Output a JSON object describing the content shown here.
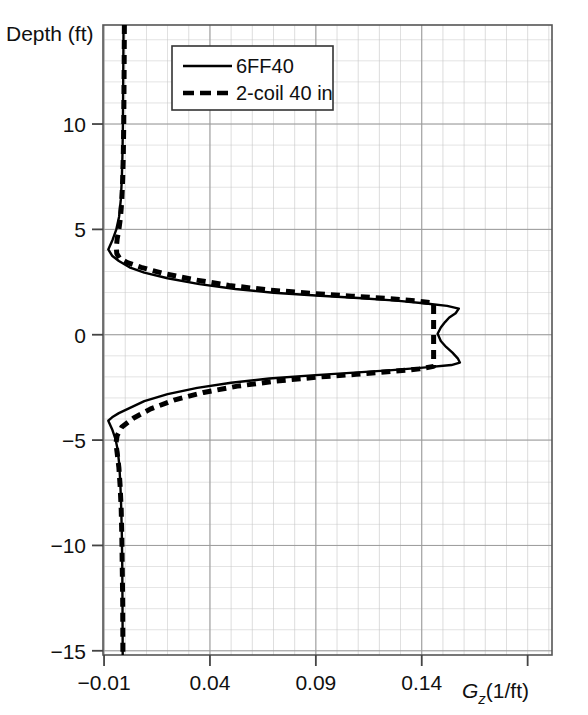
{
  "chart_data": {
    "type": "line",
    "title": "",
    "xlabel": "Gz(1/ft)",
    "xlabel_symbol": "G",
    "xlabel_subscript": "z",
    "xlabel_units": "(1/ft)",
    "ylabel": "Depth (ft)",
    "xlim": [
      -0.0105,
      0.2015
    ],
    "ylim": [
      -15.2,
      14.7
    ],
    "xticks": [
      -0.01,
      0.04,
      0.09,
      0.14
    ],
    "xtick_labels": [
      "−0.01",
      "0.04",
      "0.09",
      "0.14"
    ],
    "yticks": [
      10,
      5,
      0,
      -5,
      -10,
      -15
    ],
    "ytick_labels": [
      "10",
      "5",
      "0",
      "−5",
      "−10",
      "−15"
    ],
    "x_minor_step": 0.01,
    "y_minor_step": 1,
    "grid": true,
    "grid_color": "#c8c8c8",
    "axis_color": "#555555",
    "line_color": "#000000",
    "background": "#ffffff",
    "legend": {
      "position": "top-left-inside",
      "entries": [
        {
          "label": "6FF40",
          "style": "solid"
        },
        {
          "label": "2-coil 40 in",
          "style": "dashed"
        }
      ]
    },
    "series": [
      {
        "name": "6FF40",
        "style": "solid",
        "xname": "Gz",
        "yname": "Depth",
        "points": [
          [
            -0.0008,
            14.7
          ],
          [
            -0.0009,
            13.0
          ],
          [
            -0.001,
            11.5
          ],
          [
            -0.0011,
            10.0
          ],
          [
            -0.0013,
            8.6
          ],
          [
            -0.0016,
            7.4
          ],
          [
            -0.0021,
            6.4
          ],
          [
            -0.0029,
            5.6
          ],
          [
            -0.0042,
            5.0
          ],
          [
            -0.006,
            4.5
          ],
          [
            -0.008,
            4.05
          ],
          [
            -0.0062,
            3.75
          ],
          [
            -0.003,
            3.5
          ],
          [
            0.002,
            3.2
          ],
          [
            0.009,
            2.95
          ],
          [
            0.02,
            2.68
          ],
          [
            0.035,
            2.4
          ],
          [
            0.052,
            2.17
          ],
          [
            0.07,
            1.99
          ],
          [
            0.09,
            1.86
          ],
          [
            0.11,
            1.74
          ],
          [
            0.128,
            1.62
          ],
          [
            0.142,
            1.48
          ],
          [
            0.152,
            1.37
          ],
          [
            0.1575,
            1.24
          ],
          [
            0.156,
            1.02
          ],
          [
            0.153,
            0.82
          ],
          [
            0.151,
            0.6
          ],
          [
            0.149,
            0.34
          ],
          [
            0.1475,
            0.05
          ],
          [
            0.149,
            -0.3
          ],
          [
            0.1515,
            -0.58
          ],
          [
            0.1545,
            -0.85
          ],
          [
            0.157,
            -1.12
          ],
          [
            0.158,
            -1.32
          ],
          [
            0.154,
            -1.44
          ],
          [
            0.142,
            -1.55
          ],
          [
            0.126,
            -1.68
          ],
          [
            0.108,
            -1.8
          ],
          [
            0.088,
            -1.93
          ],
          [
            0.068,
            -2.08
          ],
          [
            0.05,
            -2.28
          ],
          [
            0.034,
            -2.52
          ],
          [
            0.02,
            -2.82
          ],
          [
            0.009,
            -3.15
          ],
          [
            0.002,
            -3.48
          ],
          [
            -0.003,
            -3.72
          ],
          [
            -0.0062,
            -3.92
          ],
          [
            -0.008,
            -4.08
          ],
          [
            -0.0062,
            -4.48
          ],
          [
            -0.0046,
            -4.95
          ],
          [
            -0.0035,
            -5.5
          ],
          [
            -0.0028,
            -6.2
          ],
          [
            -0.0023,
            -7.1
          ],
          [
            -0.0019,
            -8.2
          ],
          [
            -0.0016,
            -9.5
          ],
          [
            -0.0014,
            -11.0
          ],
          [
            -0.0013,
            -12.6
          ],
          [
            -0.0012,
            -15.2
          ]
        ]
      },
      {
        "name": "2-coil 40 in",
        "style": "dashed",
        "xname": "Gz",
        "yname": "Depth",
        "points": [
          [
            -0.0004,
            14.7
          ],
          [
            -0.0005,
            13.0
          ],
          [
            -0.0006,
            11.5
          ],
          [
            -0.0007,
            10.0
          ],
          [
            -0.0009,
            8.6
          ],
          [
            -0.0012,
            7.4
          ],
          [
            -0.0016,
            6.4
          ],
          [
            -0.0022,
            5.6
          ],
          [
            -0.003,
            5.0
          ],
          [
            -0.0038,
            4.55
          ],
          [
            -0.0042,
            4.15
          ],
          [
            -0.004,
            3.85
          ],
          [
            -0.0026,
            3.62
          ],
          [
            0.001,
            3.42
          ],
          [
            0.0075,
            3.2
          ],
          [
            0.0175,
            2.92
          ],
          [
            0.032,
            2.62
          ],
          [
            0.049,
            2.34
          ],
          [
            0.067,
            2.13
          ],
          [
            0.087,
            1.97
          ],
          [
            0.107,
            1.83
          ],
          [
            0.125,
            1.71
          ],
          [
            0.138,
            1.6
          ],
          [
            0.1456,
            1.5
          ],
          [
            0.1456,
            0.8
          ],
          [
            0.1456,
            0.0
          ],
          [
            0.1456,
            -0.8
          ],
          [
            0.1456,
            -1.5
          ],
          [
            0.139,
            -1.62
          ],
          [
            0.126,
            -1.74
          ],
          [
            0.109,
            -1.88
          ],
          [
            0.09,
            -2.02
          ],
          [
            0.071,
            -2.2
          ],
          [
            0.053,
            -2.44
          ],
          [
            0.037,
            -2.74
          ],
          [
            0.023,
            -3.1
          ],
          [
            0.012,
            -3.52
          ],
          [
            0.004,
            -3.95
          ],
          [
            -0.0016,
            -4.38
          ],
          [
            -0.0038,
            -4.78
          ],
          [
            -0.0044,
            -5.15
          ],
          [
            -0.0038,
            -5.62
          ],
          [
            -0.003,
            -6.3
          ],
          [
            -0.0024,
            -7.2
          ],
          [
            -0.0019,
            -8.3
          ],
          [
            -0.0016,
            -9.6
          ],
          [
            -0.0014,
            -11.1
          ],
          [
            -0.0012,
            -12.7
          ],
          [
            -0.0011,
            -15.2
          ]
        ]
      }
    ]
  },
  "figure": {
    "ylabel_text": "Depth (ft)"
  }
}
